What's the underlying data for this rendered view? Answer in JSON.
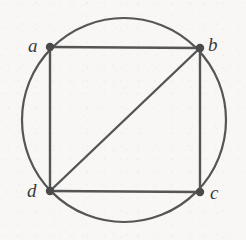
{
  "figure": {
    "type": "geometry-diagram",
    "caption": "",
    "canvas": {
      "width": 246,
      "height": 240
    },
    "background_color": "#f8f7f5",
    "stroke_color": "#555555",
    "label_color": "#3b3b3b",
    "vertex_fill_color": "#4a4a4a",
    "circle": {
      "name": "circumscribed-circle",
      "cx": 124,
      "cy": 120,
      "r": 102,
      "stroke_width": 2.2
    },
    "vertices": [
      {
        "id": "a",
        "label": "a",
        "x": 50,
        "y": 47,
        "label_x": 28,
        "label_y": 36,
        "dot_r": 4.2
      },
      {
        "id": "b",
        "label": "b",
        "x": 200,
        "y": 48,
        "label_x": 208,
        "label_y": 35,
        "dot_r": 4.2
      },
      {
        "id": "c",
        "label": "c",
        "x": 200,
        "y": 192,
        "label_x": 210,
        "label_y": 183,
        "dot_r": 4.2
      },
      {
        "id": "d",
        "label": "d",
        "x": 50,
        "y": 191,
        "label_x": 27,
        "label_y": 181,
        "dot_r": 4.2
      }
    ],
    "edges": [
      {
        "id": "ab",
        "name": "edge-a-b",
        "from": "a",
        "to": "b",
        "x1": 50,
        "y1": 47,
        "x2": 200,
        "y2": 48,
        "stroke_width": 2.4
      },
      {
        "id": "bc",
        "name": "edge-b-c",
        "from": "b",
        "to": "c",
        "x1": 200,
        "y1": 48,
        "x2": 200,
        "y2": 192,
        "stroke_width": 2.4
      },
      {
        "id": "cd",
        "name": "edge-c-d",
        "from": "c",
        "to": "d",
        "x1": 200,
        "y1": 192,
        "x2": 50,
        "y2": 191,
        "stroke_width": 2.4
      },
      {
        "id": "da",
        "name": "edge-d-a",
        "from": "d",
        "to": "a",
        "x1": 50,
        "y1": 191,
        "x2": 50,
        "y2": 47,
        "stroke_width": 2.4
      },
      {
        "id": "db",
        "name": "diagonal-d-b",
        "from": "d",
        "to": "b",
        "x1": 50,
        "y1": 191,
        "x2": 200,
        "y2": 48,
        "stroke_width": 2.4
      }
    ]
  }
}
